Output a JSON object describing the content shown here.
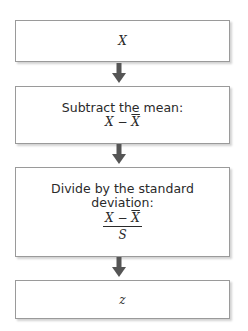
{
  "flowchart": {
    "steps": [
      {
        "label": "",
        "expression": "X"
      },
      {
        "label": "Subtract the mean:",
        "expression_left": "X",
        "operator": "−",
        "expression_right": "X"
      },
      {
        "label_line1": "Divide by the standard",
        "label_line2": "deviation:",
        "numerator_left": "X",
        "operator": "−",
        "numerator_right": "X",
        "denominator": "S"
      },
      {
        "label": "",
        "expression": "z"
      }
    ],
    "arrow_color": "#555555",
    "arrow_icon": "arrow-down-icon"
  }
}
